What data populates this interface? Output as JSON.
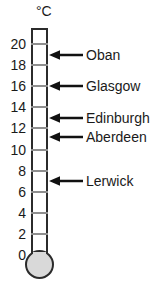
{
  "figure": {
    "unit_label": "°C",
    "tube_color": "#ffffff",
    "outline_color": "#2b2b2b",
    "bulb_color": "#d9d9d9",
    "tick_color": "#8e8e8e",
    "text_color": "#1a1a1a"
  },
  "scale": {
    "min": 0,
    "max": 21,
    "tick_step": 2,
    "labels": [
      "20",
      "18",
      "16",
      "14",
      "12",
      "10",
      "8",
      "6",
      "4",
      "2",
      "0"
    ],
    "tick_values": [
      20,
      18,
      16,
      14,
      12,
      10,
      8,
      6,
      4,
      2,
      0
    ]
  },
  "readings": [
    {
      "label": "Oban",
      "value": 19.0
    },
    {
      "label": "Glasgow",
      "value": 16.0
    },
    {
      "label": "Edinburgh",
      "value": 13.0
    },
    {
      "label": "Aberdeen",
      "value": 11.2
    },
    {
      "label": "Lerwick",
      "value": 7.0
    }
  ],
  "chart_data": {
    "type": "bar",
    "xlabel": "",
    "ylabel": "°C",
    "categories": [
      "Oban",
      "Glasgow",
      "Edinburgh",
      "Aberdeen",
      "Lerwick"
    ],
    "values": [
      19.0,
      16.0,
      13.0,
      11.2,
      7.0
    ],
    "ylim": [
      0,
      21
    ],
    "ytick_step": 2,
    "grid": false,
    "legend": "none"
  }
}
